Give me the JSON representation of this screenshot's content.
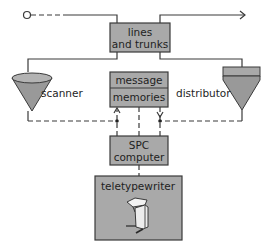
{
  "diagram": {
    "nodes": {
      "lines_trunks": {
        "line1": "lines",
        "line2": "and trunks"
      },
      "message_memories": {
        "line1": "message",
        "line2": "memories"
      },
      "spc_computer": {
        "line1": "SPC",
        "line2": "computer"
      },
      "teletypewriter": {
        "label": "teletypewriter"
      },
      "scanner": {
        "label": "scanner"
      },
      "distributor": {
        "label": "distributor"
      }
    },
    "colors": {
      "box_fill": "#a9a9a9",
      "stroke": "#3a3a3a",
      "text": "#1e1e1e"
    }
  }
}
